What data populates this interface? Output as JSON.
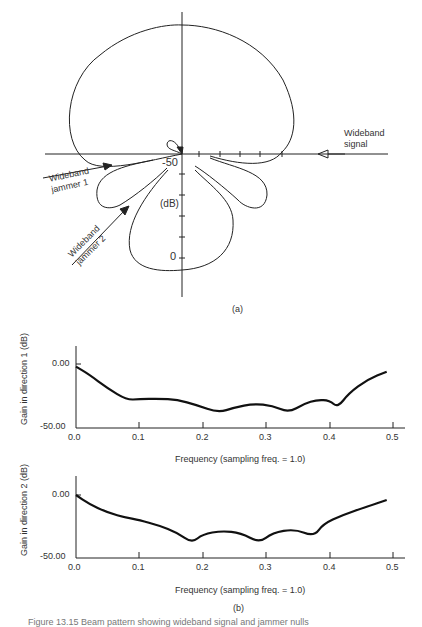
{
  "panel_a": {
    "label": "(a)",
    "scale_unit": "(dB)",
    "tick_top": "-50",
    "tick_bottom": "0",
    "signal_label": [
      "Wideband",
      "signal"
    ],
    "jammer1_label": [
      "Wideband",
      "jammer 1"
    ],
    "jammer2_label": [
      "Wideband",
      "jammer 2"
    ]
  },
  "panel_b": {
    "label": "(b)"
  },
  "caption": "Figure 13.15  Beam pattern showing wideband signal and jammer nulls",
  "chart_data": [
    {
      "type": "polar",
      "title": "Array beam pattern (a)",
      "radial_axis": {
        "label": "(dB)",
        "ticks": [
          "-50",
          "0"
        ],
        "range": [
          -50,
          0
        ]
      },
      "annotations": [
        "Wideband signal",
        "Wideband jammer 1",
        "Wideband jammer 2"
      ],
      "lobes": [
        {
          "name": "main lobe",
          "direction": "up"
        },
        {
          "name": "side lobe left",
          "direction": "down-left"
        },
        {
          "name": "side lobe right",
          "direction": "down-right"
        },
        {
          "name": "lower lobe",
          "direction": "down"
        }
      ]
    },
    {
      "type": "line",
      "title": "",
      "xlabel": "Frequency (sampling freq. = 1.0)",
      "ylabel": "Gain in direction 1 (dB)",
      "xlim": [
        0.0,
        0.5
      ],
      "ylim": [
        -50.0,
        0.0
      ],
      "x_ticks": [
        "0.0",
        "0.1",
        "0.2",
        "0.3",
        "0.4",
        "0.5"
      ],
      "y_ticks": [
        "0.00",
        "-50.00"
      ],
      "grid": false,
      "x": [
        0.0,
        0.02,
        0.05,
        0.08,
        0.1,
        0.13,
        0.16,
        0.19,
        0.224,
        0.25,
        0.28,
        0.31,
        0.335,
        0.36,
        0.38,
        0.4,
        0.413,
        0.43,
        0.46,
        0.49
      ],
      "values": [
        -2,
        -8,
        -19,
        -28,
        -27.5,
        -27,
        -28,
        -32,
        -38,
        -34,
        -31,
        -32.5,
        -38,
        -31,
        -28,
        -28.5,
        -34,
        -23,
        -12,
        -6
      ]
    },
    {
      "type": "line",
      "title": "",
      "xlabel": "Frequency (sampling freq. = 1.0)",
      "ylabel": "Gain in direction 2 (dB)",
      "xlim": [
        0.0,
        0.5
      ],
      "ylim": [
        -50.0,
        0.0
      ],
      "x_ticks": [
        "0.0",
        "0.1",
        "0.2",
        "0.3",
        "0.4",
        "0.5"
      ],
      "y_ticks": [
        "0.00",
        "-50.00"
      ],
      "grid": false,
      "x": [
        0.0,
        0.02,
        0.05,
        0.08,
        0.1,
        0.13,
        0.16,
        0.183,
        0.2,
        0.23,
        0.26,
        0.289,
        0.31,
        0.345,
        0.375,
        0.39,
        0.42,
        0.46,
        0.49
      ],
      "values": [
        0,
        -7,
        -14,
        -18,
        -20,
        -24,
        -30,
        -38,
        -31,
        -28.5,
        -30,
        -38,
        -30,
        -27,
        -33,
        -23,
        -16,
        -9,
        -4
      ]
    }
  ]
}
